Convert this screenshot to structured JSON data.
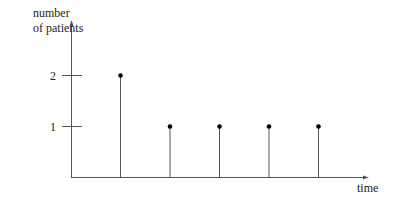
{
  "chart_data": {
    "type": "stem",
    "title": "",
    "xlabel": "time",
    "ylabel": [
      "number",
      "of patients"
    ],
    "yticks": [
      1,
      2
    ],
    "ytick_labels": [
      "1",
      "2"
    ],
    "x": [
      1,
      2,
      3,
      4,
      5
    ],
    "values": [
      2,
      1,
      1,
      1,
      1
    ],
    "xticks": [],
    "grid": false,
    "legend": null,
    "colors": {
      "line": "#555555",
      "marker": "#000000"
    }
  },
  "labels": {
    "ylabel_line1": "number",
    "ylabel_line2": "of patients",
    "xlabel": "time",
    "tick_2": "2",
    "tick_1": "1"
  }
}
